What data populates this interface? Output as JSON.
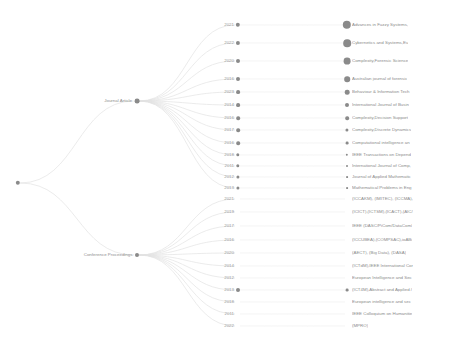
{
  "visualization": {
    "type": "hierarchical-dendrogram",
    "title": "",
    "background_color": "#ffffff",
    "link_color": "#e3e3e3",
    "node_color": "#8a8a8a",
    "text_color": "#8e8e8e"
  },
  "root": {
    "label": "",
    "x": 18,
    "y": 183,
    "radius": 2.2
  },
  "branches": [
    {
      "label": "Journal Article",
      "x": 137,
      "y": 101,
      "radius": 2.4
    },
    {
      "label": "Conference Proceedings",
      "x": 137,
      "y": 255,
      "radius": 2.0
    }
  ],
  "journal_rows": [
    {
      "year": "2021",
      "venue": "Advances in Fuzzy Systems,",
      "y": 25,
      "year_dot": 2.2,
      "venue_dot": 4.2
    },
    {
      "year": "2022",
      "venue": "Cybernetics and Systems,Eu",
      "y": 43,
      "year_dot": 2.1,
      "venue_dot": 3.8
    },
    {
      "year": "2020",
      "venue": "Complexity,Forensic Science",
      "y": 61,
      "year_dot": 2.0,
      "venue_dot": 3.4
    },
    {
      "year": "2016",
      "venue": "Australian journal of forensic",
      "y": 79,
      "year_dot": 2.0,
      "venue_dot": 2.8
    },
    {
      "year": "2023",
      "venue": "Behaviour & Information Tech",
      "y": 92,
      "year_dot": 1.9,
      "venue_dot": 2.3
    },
    {
      "year": "2014",
      "venue": "International Journal of Busin",
      "y": 105,
      "year_dot": 1.9,
      "venue_dot": 2.0
    },
    {
      "year": "2016",
      "venue": "Complexity,Decision Support",
      "y": 118,
      "year_dot": 1.8,
      "venue_dot": 1.8
    },
    {
      "year": "2017",
      "venue": "Complexity,Discrete Dynamics",
      "y": 130,
      "year_dot": 1.8,
      "venue_dot": 1.6
    },
    {
      "year": "2016",
      "venue": "Computational intelligence an",
      "y": 143,
      "year_dot": 1.8,
      "venue_dot": 1.4
    },
    {
      "year": "2018",
      "venue": "IEEE Transactions on Depend",
      "y": 155,
      "year_dot": 1.7,
      "venue_dot": 1.2
    },
    {
      "year": "2011",
      "venue": "International Journal of Comp,",
      "y": 166,
      "year_dot": 1.7,
      "venue_dot": 1.0
    },
    {
      "year": "2012",
      "venue": "Journal of Applied Mathematic",
      "y": 177,
      "year_dot": 1.6,
      "venue_dot": 0.9
    },
    {
      "year": "2013",
      "venue": "Mathematical Problems in Eng",
      "y": 188,
      "year_dot": 1.6,
      "venue_dot": 0.9
    }
  ],
  "conference_rows": [
    {
      "year": "2021",
      "venue": "(ICCAKM), (IMITEC), (ICCMA),",
      "y": 199,
      "year_dot": 0,
      "venue_dot": 0
    },
    {
      "year": "2019",
      "venue": "(ICICT),(ICTSM),(ICACT),(AIC/",
      "y": 212,
      "year_dot": 0,
      "venue_dot": 0
    },
    {
      "year": "2017",
      "venue": "IEEE (DASC/PiCom/DataCom/",
      "y": 226,
      "year_dot": 0,
      "venue_dot": 0
    },
    {
      "year": "2016",
      "venue": "(ICCUBEA),(COMPSAC),ioABi",
      "y": 240,
      "year_dot": 0,
      "venue_dot": 0
    },
    {
      "year": "2020",
      "venue": "(AECT), (Big Data), (DASA)",
      "y": 253,
      "year_dot": 0,
      "venue_dot": 0
    },
    {
      "year": "2014",
      "venue": "(ICTdM),IEEE International Cor",
      "y": 266,
      "year_dot": 0,
      "venue_dot": 0
    },
    {
      "year": "2012",
      "venue": "European Intelligence and Sec",
      "y": 278,
      "year_dot": 0,
      "venue_dot": 0
    },
    {
      "year": "2013",
      "venue": "(ICT4M),Abstract and Applied /",
      "y": 290,
      "year_dot": 2.0,
      "venue_dot": 1.4
    },
    {
      "year": "2018",
      "venue": "European intelligence and sec",
      "y": 302,
      "year_dot": 0,
      "venue_dot": 0
    },
    {
      "year": "2011",
      "venue": "IEEE Colloquium on Humanitie",
      "y": 314,
      "year_dot": 0,
      "venue_dot": 0
    },
    {
      "year": "2022",
      "venue": "(MPRO)",
      "y": 326,
      "year_dot": 0,
      "venue_dot": 0
    }
  ],
  "layout": {
    "year_dot_x": 238,
    "year_label_x": 234,
    "venue_dot_x": 347,
    "venue_label_x": 352,
    "canvas_width": 455,
    "canvas_height": 339
  }
}
